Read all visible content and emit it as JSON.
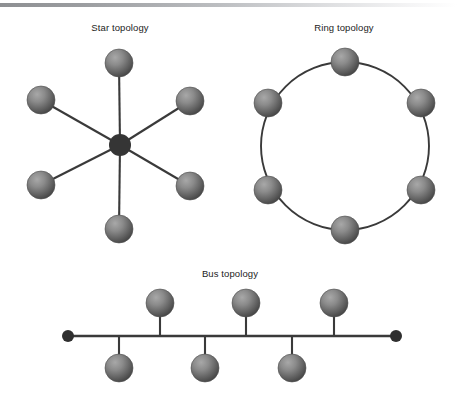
{
  "page": {
    "background_color": "#ffffff",
    "width": 457,
    "height": 402
  },
  "header_rule": {
    "name": "top-gradient-rule",
    "start_color": "#8d8f92",
    "end_color": "#ffffff",
    "y": 3,
    "height": 4
  },
  "palette": {
    "sphere_highlight": "#a3a3a3",
    "sphere_mid": "#6e6e6e",
    "sphere_edge": "#4a4a4a",
    "sphere_outline": "#4f4f4f",
    "line_color": "#3a3a3a",
    "hub_color": "#353535",
    "terminator_color": "#2f2f2f",
    "label_color": "#1c1c1c"
  },
  "diagrams": [
    {
      "id": "star",
      "label": "Star topology",
      "label_x": 120,
      "label_y": 31,
      "hub": {
        "cx": 120,
        "cy": 145,
        "r": 11
      },
      "node_radius": 14,
      "nodes": [
        {
          "name": "star-node-top",
          "cx": 119,
          "cy": 63
        },
        {
          "name": "star-node-upper-left",
          "cx": 41,
          "cy": 100
        },
        {
          "name": "star-node-upper-right",
          "cx": 190,
          "cy": 101
        },
        {
          "name": "star-node-lower-left",
          "cx": 41,
          "cy": 185
        },
        {
          "name": "star-node-lower-right",
          "cx": 190,
          "cy": 186
        },
        {
          "name": "star-node-bottom",
          "cx": 119,
          "cy": 229
        }
      ]
    },
    {
      "id": "ring",
      "label": "Ring topology",
      "label_x": 344,
      "label_y": 31,
      "ring": {
        "cx": 345,
        "cy": 146,
        "r": 84
      },
      "node_radius": 14,
      "nodes": [
        {
          "name": "ring-node-top",
          "cx": 345,
          "cy": 62
        },
        {
          "name": "ring-node-upper-left",
          "cx": 268,
          "cy": 103
        },
        {
          "name": "ring-node-upper-right",
          "cx": 421,
          "cy": 103
        },
        {
          "name": "ring-node-lower-left",
          "cx": 268,
          "cy": 190
        },
        {
          "name": "ring-node-lower-right",
          "cx": 421,
          "cy": 190
        },
        {
          "name": "ring-node-bottom",
          "cx": 345,
          "cy": 230
        }
      ]
    },
    {
      "id": "bus",
      "label": "Bus topology",
      "label_x": 230,
      "label_y": 277,
      "bus_line": {
        "x1": 68,
        "x2": 396,
        "y": 336
      },
      "terminators": [
        {
          "name": "bus-terminator-left",
          "cx": 68,
          "cy": 336,
          "r": 6
        },
        {
          "name": "bus-terminator-right",
          "cx": 396,
          "cy": 336,
          "r": 6
        }
      ],
      "node_radius": 14,
      "nodes_above": [
        {
          "name": "bus-node-top-1",
          "cx": 160,
          "cy": 303
        },
        {
          "name": "bus-node-top-2",
          "cx": 246,
          "cy": 303
        },
        {
          "name": "bus-node-top-3",
          "cx": 334,
          "cy": 303
        }
      ],
      "nodes_below": [
        {
          "name": "bus-node-bottom-1",
          "cx": 119,
          "cy": 368
        },
        {
          "name": "bus-node-bottom-2",
          "cx": 205,
          "cy": 368
        },
        {
          "name": "bus-node-bottom-3",
          "cx": 292,
          "cy": 368
        }
      ]
    }
  ]
}
